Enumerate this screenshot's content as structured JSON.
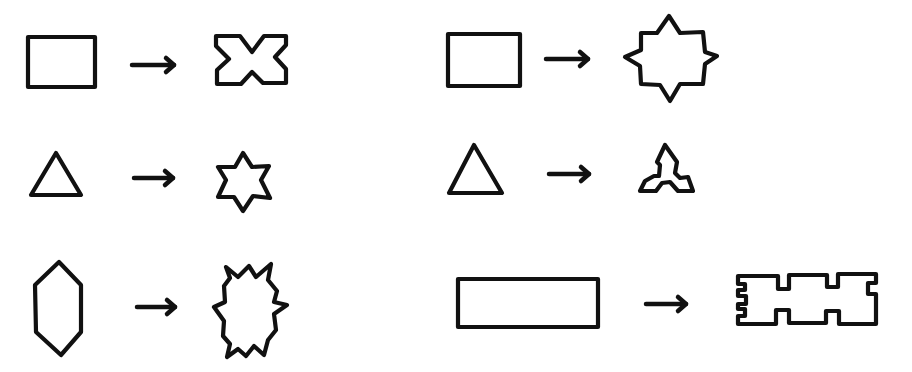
{
  "diagram": {
    "stroke_color": "#111111",
    "background": "#ffffff",
    "pairs": [
      {
        "id": "rect-to-cross",
        "source": {
          "name": "rectangle",
          "points": [
            [
              28,
              37
            ],
            [
              95,
              37
            ],
            [
              95,
              87
            ],
            [
              28,
              87
            ]
          ]
        },
        "arrow": {
          "x1": 132,
          "x2": 174,
          "y": 65
        },
        "target": {
          "name": "cross-notched-rectangle",
          "points": [
            [
              216,
              36
            ],
            [
              240,
              36
            ],
            [
              252,
              52
            ],
            [
              264,
              36
            ],
            [
              286,
              36
            ],
            [
              286,
              45
            ],
            [
              275,
              57
            ],
            [
              286,
              69
            ],
            [
              286,
              83
            ],
            [
              263,
              83
            ],
            [
              252,
              72
            ],
            [
              241,
              84
            ],
            [
              217,
              84
            ],
            [
              217,
              70
            ],
            [
              229,
              59
            ],
            [
              216,
              46
            ]
          ]
        }
      },
      {
        "id": "rect-to-eight-point-star",
        "source": {
          "name": "rectangle",
          "points": [
            [
              448,
              34
            ],
            [
              520,
              34
            ],
            [
              520,
              86
            ],
            [
              448,
              86
            ]
          ]
        },
        "arrow": {
          "x1": 546,
          "x2": 588,
          "y": 59
        },
        "target": {
          "name": "eight-point-star",
          "points": [
            [
              669,
              16
            ],
            [
              680,
              33
            ],
            [
              703,
              32
            ],
            [
              705,
              52
            ],
            [
              717,
              56
            ],
            [
              705,
              64
            ],
            [
              703,
              84
            ],
            [
              680,
              84
            ],
            [
              670,
              101
            ],
            [
              660,
              85
            ],
            [
              641,
              84
            ],
            [
              640,
              66
            ],
            [
              625,
              57
            ],
            [
              641,
              50
            ],
            [
              641,
              33
            ],
            [
              657,
              33
            ]
          ]
        }
      },
      {
        "id": "triangle-to-six-point-star",
        "source": {
          "name": "triangle",
          "points": [
            [
              56,
              153
            ],
            [
              81,
              195
            ],
            [
              31,
              195
            ]
          ]
        },
        "arrow": {
          "x1": 134,
          "x2": 173,
          "y": 178
        },
        "target": {
          "name": "six-point-star",
          "points": [
            [
              243,
              153
            ],
            [
              252,
              167
            ],
            [
              269,
              166
            ],
            [
              261,
              180
            ],
            [
              270,
              198
            ],
            [
              253,
              196
            ],
            [
              243,
              211
            ],
            [
              234,
              197
            ],
            [
              218,
              197
            ],
            [
              226,
              180
            ],
            [
              218,
              167
            ],
            [
              235,
              167
            ]
          ]
        }
      },
      {
        "id": "triangle-to-trefoil",
        "source": {
          "name": "triangle",
          "points": [
            [
              474,
              145
            ],
            [
              502,
              193
            ],
            [
              449,
              193
            ]
          ]
        },
        "arrow": {
          "x1": 549,
          "x2": 589,
          "y": 174
        },
        "target": {
          "name": "notched-triangle",
          "points": [
            [
              665,
              145
            ],
            [
              677,
              162
            ],
            [
              675,
              173
            ],
            [
              680,
              178
            ],
            [
              688,
              177
            ],
            [
              693,
              191
            ],
            [
              678,
              191
            ],
            [
              670,
              182
            ],
            [
              662,
              183
            ],
            [
              656,
              191
            ],
            [
              640,
              191
            ],
            [
              645,
              181
            ],
            [
              654,
              176
            ],
            [
              659,
              176
            ],
            [
              660,
              165
            ],
            [
              657,
              162
            ]
          ]
        }
      },
      {
        "id": "hexagon-to-spiky-oval",
        "source": {
          "name": "elongated-hexagon",
          "points": [
            [
              59,
              262
            ],
            [
              81,
              285
            ],
            [
              81,
              332
            ],
            [
              61,
              355
            ],
            [
              36,
              332
            ],
            [
              35,
              285
            ]
          ]
        },
        "arrow": {
          "x1": 137,
          "x2": 175,
          "y": 307
        },
        "target": {
          "name": "spiky-oval",
          "points": [
            [
              226,
              267
            ],
            [
              238,
              277
            ],
            [
              249,
              266
            ],
            [
              256,
              277
            ],
            [
              271,
              264
            ],
            [
              268,
              280
            ],
            [
              277,
              291
            ],
            [
              274,
              302
            ],
            [
              287,
              305
            ],
            [
              274,
              314
            ],
            [
              276,
              330
            ],
            [
              268,
              340
            ],
            [
              264,
              355
            ],
            [
              254,
              346
            ],
            [
              246,
              356
            ],
            [
              238,
              349
            ],
            [
              227,
              357
            ],
            [
              230,
              344
            ],
            [
              223,
              336
            ],
            [
              224,
              321
            ],
            [
              214,
              307
            ],
            [
              225,
              302
            ],
            [
              224,
              286
            ],
            [
              230,
              278
            ]
          ]
        }
      },
      {
        "id": "long-rect-to-castellated",
        "source": {
          "name": "long-rectangle",
          "points": [
            [
              458,
              279
            ],
            [
              598,
              279
            ],
            [
              598,
              327
            ],
            [
              458,
              327
            ]
          ]
        },
        "arrow": {
          "x1": 646,
          "x2": 686,
          "y": 304
        },
        "target": {
          "name": "castellated-rectangle",
          "points": [
            [
              738,
              276
            ],
            [
              778,
              276
            ],
            [
              778,
              289
            ],
            [
              789,
              289
            ],
            [
              789,
              275
            ],
            [
              827,
              275
            ],
            [
              827,
              287
            ],
            [
              838,
              287
            ],
            [
              838,
              274
            ],
            [
              876,
              274
            ],
            [
              876,
              283
            ],
            [
              868,
              283
            ],
            [
              868,
              294
            ],
            [
              876,
              294
            ],
            [
              876,
              324
            ],
            [
              839,
              324
            ],
            [
              839,
              311
            ],
            [
              826,
              311
            ],
            [
              826,
              323
            ],
            [
              789,
              323
            ],
            [
              789,
              310
            ],
            [
              776,
              310
            ],
            [
              776,
              324
            ],
            [
              738,
              324
            ],
            [
              738,
              316
            ],
            [
              745,
              316
            ],
            [
              745,
              309
            ],
            [
              738,
              309
            ],
            [
              738,
              304
            ],
            [
              746,
              304
            ],
            [
              746,
              296
            ],
            [
              738,
              296
            ],
            [
              738,
              290
            ],
            [
              745,
              290
            ],
            [
              745,
              284
            ],
            [
              738,
              284
            ]
          ]
        }
      }
    ]
  }
}
